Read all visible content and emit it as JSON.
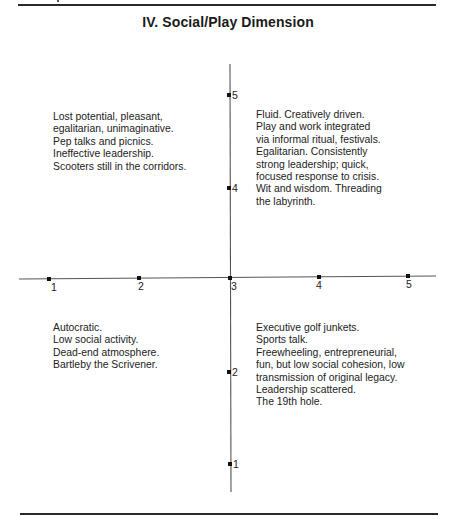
{
  "header": {
    "title": "IV. Social/Play Dimension"
  },
  "axes": {
    "x_ticks": [
      "1",
      "2",
      "3",
      "4",
      "5"
    ],
    "y_ticks": [
      "5",
      "4",
      "2",
      "1"
    ],
    "line_color": "#555555",
    "tick_color": "#111111"
  },
  "quadrants": {
    "top_left": {
      "lines": [
        "Lost potential, pleasant,",
        "egalitarian, unimaginative.",
        "Pep talks and picnics.",
        "Ineffective leadership.",
        "Scooters still in the corridors."
      ]
    },
    "top_right": {
      "lines": [
        "Fluid.  Creatively driven.",
        "Play and work integrated",
        "via informal ritual, festivals.",
        "Egalitarian.  Consistently",
        "strong leadership; quick,",
        "focused response to crisis.",
        "Wit and wisdom.  Threading",
        "the labyrinth."
      ]
    },
    "bottom_left": {
      "lines": [
        "Autocratic.",
        "Low social activity.",
        "Dead-end atmosphere.",
        "Bartleby the Scrivener."
      ]
    },
    "bottom_right": {
      "lines": [
        "Executive golf junkets.",
        "Sports talk.",
        "Freewheeling, entrepreneurial,",
        "fun, but low social cohesion, low",
        "transmission of original legacy.",
        "Leadership scattered.",
        "The 19th hole."
      ]
    }
  }
}
